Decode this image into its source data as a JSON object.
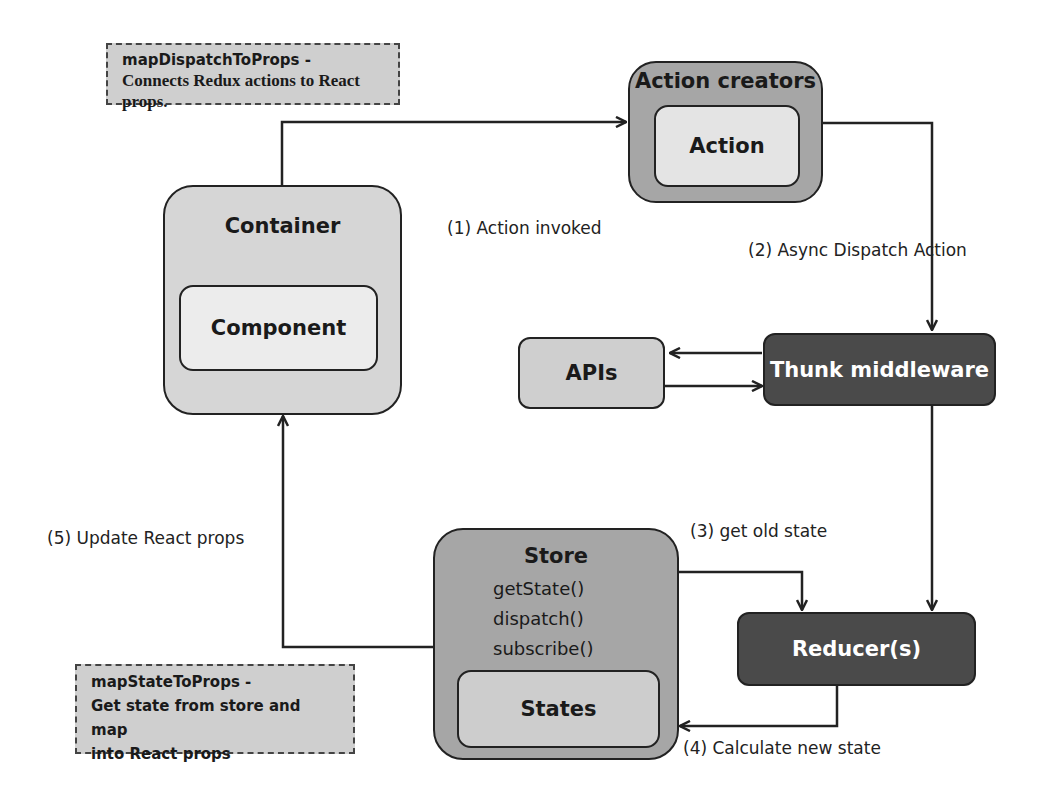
{
  "diagram": {
    "colors": {
      "light_box": "#d6d6d6",
      "inner_light": "#ececec",
      "mid_box": "#a6a6a6",
      "dark_box": "#4a4a4a",
      "note_bg": "#cfcfcf",
      "line": "#222222"
    },
    "notes": {
      "dispatch_title": "mapDispatchToProps -",
      "dispatch_body": "Connects Redux actions to React props.",
      "state_title": "mapStateToProps -",
      "state_body_1": "Get state from store and map",
      "state_body_2": "into React props"
    },
    "nodes": {
      "container": "Container",
      "component": "Component",
      "action_creators": "Action creators",
      "action": "Action",
      "apis": "APIs",
      "thunk": "Thunk middleware",
      "store": "Store",
      "store_methods": [
        "getState()",
        "dispatch()",
        "subscribe()"
      ],
      "states": "States",
      "reducers": "Reducer(s)"
    },
    "edges": {
      "step1": "(1) Action invoked",
      "step2": "(2) Async Dispatch Action",
      "step3": "(3) get old state",
      "step4": "(4) Calculate new state",
      "step5": "(5) Update React props"
    }
  }
}
